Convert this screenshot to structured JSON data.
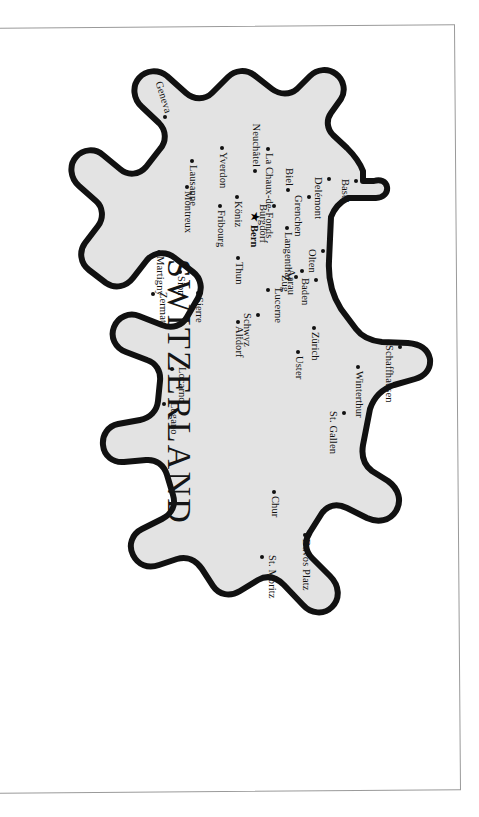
{
  "document": {
    "kind": "map-figure",
    "title": "SWITZERLAND",
    "orientation_note": "page printed sideways; map rotated 90 degrees clockwise",
    "capital_marker": "star"
  },
  "colors": {
    "land_fill": "#e3e3e3",
    "outline": "#111111",
    "dot": "#111111",
    "label_text": "#111111",
    "page_background": "#ffffff",
    "frame_line": "#9a9a9a"
  },
  "map": {
    "title": "SWITZERLAND",
    "capital": "Bern",
    "cities": [
      {
        "name": "Basel",
        "x": 152,
        "y": 104,
        "anchor": "below",
        "capital": false
      },
      {
        "name": "Schaffhausen",
        "x": 318,
        "y": 60,
        "anchor": "below",
        "capital": false
      },
      {
        "name": "Winterthur",
        "x": 338,
        "y": 102,
        "anchor": "right",
        "capital": false
      },
      {
        "name": "St. Gallen",
        "x": 384,
        "y": 116,
        "anchor": "below",
        "capital": false
      },
      {
        "name": "Zürich",
        "x": 299,
        "y": 146,
        "anchor": "right",
        "capital": false
      },
      {
        "name": "Uster",
        "x": 323,
        "y": 162,
        "anchor": "right",
        "capital": false
      },
      {
        "name": "Baden",
        "x": 251,
        "y": 144,
        "anchor": "below",
        "capital": false
      },
      {
        "name": "Aarau",
        "x": 242,
        "y": 158,
        "anchor": "below",
        "capital": false
      },
      {
        "name": "Olten",
        "x": 222,
        "y": 137,
        "anchor": "below",
        "capital": false
      },
      {
        "name": "Zug",
        "x": 248,
        "y": 164,
        "anchor": "below",
        "capital": false
      },
      {
        "name": "Schwyz",
        "x": 286,
        "y": 202,
        "anchor": "below",
        "capital": false
      },
      {
        "name": "Altdorf",
        "x": 293,
        "y": 222,
        "anchor": "right",
        "capital": false
      },
      {
        "name": "Langenthal",
        "x": 199,
        "y": 173,
        "anchor": "right",
        "capital": false
      },
      {
        "name": "Burgdorf",
        "x": 177,
        "y": 186,
        "anchor": "below",
        "capital": false
      },
      {
        "name": "Lucerne",
        "x": 261,
        "y": 192,
        "anchor": "above",
        "capital": false
      },
      {
        "name": "Grenchen",
        "x": 168,
        "y": 151,
        "anchor": "below",
        "capital": false
      },
      {
        "name": "Delémont",
        "x": 150,
        "y": 131,
        "anchor": "below",
        "capital": false
      },
      {
        "name": "Biel",
        "x": 161,
        "y": 172,
        "anchor": "left",
        "capital": false
      },
      {
        "name": "Bern",
        "x": 188,
        "y": 207,
        "anchor": "right",
        "capital": true
      },
      {
        "name": "Thun",
        "x": 229,
        "y": 222,
        "anchor": "right",
        "capital": false
      },
      {
        "name": "La Chaux-de-Fonds",
        "x": 120,
        "y": 192,
        "anchor": "right",
        "capital": false
      },
      {
        "name": "Neuchâtel",
        "x": 142,
        "y": 205,
        "anchor": "left",
        "capital": false
      },
      {
        "name": "Köniz",
        "x": 168,
        "y": 223,
        "anchor": "right",
        "capital": false
      },
      {
        "name": "Fribourg",
        "x": 177,
        "y": 240,
        "anchor": "right",
        "capital": false
      },
      {
        "name": "Yverdon",
        "x": 119,
        "y": 238,
        "anchor": "right",
        "capital": false
      },
      {
        "name": "Lausanne",
        "x": 132,
        "y": 268,
        "anchor": "right",
        "capital": false
      },
      {
        "name": "Montreux",
        "x": 158,
        "y": 273,
        "anchor": "right",
        "capital": false
      },
      {
        "name": "Geneva",
        "x": 88,
        "y": 295,
        "anchor": "left",
        "capital": false
      },
      {
        "name": "Martigny",
        "x": 223,
        "y": 301,
        "anchor": "right",
        "capital": false
      },
      {
        "name": "Sion",
        "x": 243,
        "y": 280,
        "anchor": "right",
        "capital": false
      },
      {
        "name": "Sierre",
        "x": 264,
        "y": 262,
        "anchor": "right",
        "capital": false
      },
      {
        "name": "Zermatt",
        "x": 265,
        "y": 307,
        "anchor": "above",
        "capital": false
      },
      {
        "name": "Locarno",
        "x": 340,
        "y": 288,
        "anchor": "above",
        "capital": false
      },
      {
        "name": "Lugano",
        "x": 375,
        "y": 296,
        "anchor": "above",
        "capital": false
      },
      {
        "name": "Chur",
        "x": 463,
        "y": 186,
        "anchor": "right",
        "capital": false
      },
      {
        "name": "Davos Platz",
        "x": 506,
        "y": 155,
        "anchor": "right",
        "capital": false
      },
      {
        "name": "St. Moritz",
        "x": 528,
        "y": 198,
        "anchor": "above",
        "capital": false
      }
    ],
    "title_position": {
      "x": 230,
      "y": 262
    }
  }
}
